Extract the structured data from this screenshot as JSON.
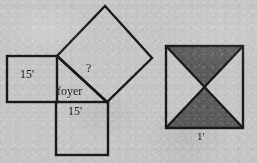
{
  "page": {
    "background_color": "#c6c5c3",
    "ink_color": "#1a1a1a",
    "shade_color": "#5a5a5a",
    "width": 257,
    "height": 163
  },
  "figures": {
    "pythagorean_foyer": {
      "name": "pythagorean-foyer-diagram",
      "labels": {
        "left_square_side": "15'",
        "bottom_square_side": "15'",
        "hypotenuse_unknown": "?",
        "region_name": "foyer"
      },
      "parts": [
        {
          "name": "left-square",
          "shape": "square",
          "label": "15'"
        },
        {
          "name": "bottom-square",
          "shape": "square",
          "label": "15'"
        },
        {
          "name": "hypotenuse-square",
          "shape": "rotated-square",
          "label": "?"
        },
        {
          "name": "foyer-triangle",
          "shape": "right-triangle",
          "label": "foyer"
        }
      ]
    },
    "tiled_square": {
      "name": "shaded-tile-diagram",
      "labels": {
        "side": "1'"
      },
      "parts": [
        {
          "name": "tile-outer-square",
          "shape": "square"
        },
        {
          "name": "tile-diagonal-nw-se",
          "shape": "line"
        },
        {
          "name": "tile-diagonal-ne-sw",
          "shape": "line"
        },
        {
          "name": "tile-triangle-top",
          "shape": "triangle",
          "shaded": true
        },
        {
          "name": "tile-triangle-bottom",
          "shape": "triangle",
          "shaded": true
        },
        {
          "name": "tile-triangle-left",
          "shape": "triangle",
          "shaded": false
        },
        {
          "name": "tile-triangle-right",
          "shape": "triangle",
          "shaded": false
        }
      ]
    }
  }
}
